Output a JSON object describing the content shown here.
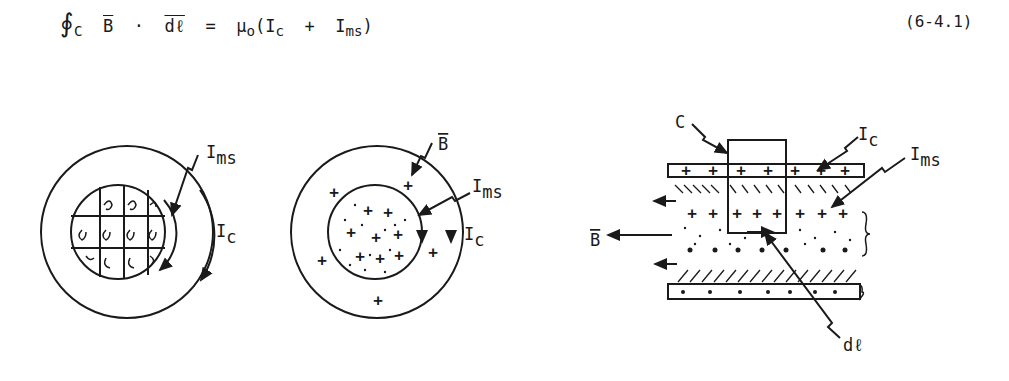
{
  "equation": {
    "integral_symbol": "∮",
    "contour_sub": "C",
    "lhs_field": "B",
    "dot": "·",
    "lhs_element": "dℓ",
    "equals": "=",
    "mu": "μ",
    "mu_sub": "o",
    "open_paren": "(",
    "I1": "I",
    "I1_sub": "c",
    "plus": "+",
    "I2": "I",
    "I2_sub": "ms",
    "close_paren": ")",
    "number": "(6-4.1)"
  },
  "figure_left": {
    "label_Ims": "I",
    "label_Ims_sub": "ms",
    "label_Ic": "I",
    "label_Ic_sub": "c"
  },
  "figure_middle": {
    "label_B": "B",
    "label_Ims": "I",
    "label_Ims_sub": "ms",
    "label_Ic": "I",
    "label_Ic_sub": "c"
  },
  "figure_right": {
    "label_C": "C",
    "label_Ic": "I",
    "label_Ic_sub": "c",
    "label_Ims": "I",
    "label_Ims_sub": "ms",
    "label_B": "B",
    "label_dl": "dℓ"
  }
}
